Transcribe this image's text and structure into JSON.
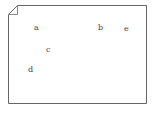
{
  "diagram": {
    "shape": "document-with-folded-corner",
    "border_color": "#666666",
    "labels": [
      {
        "text": "a",
        "x": 34,
        "y": 30
      },
      {
        "text": "b",
        "x": 99,
        "y": 30
      },
      {
        "text": "e",
        "x": 124,
        "y": 31
      },
      {
        "text": "c",
        "x": 46,
        "y": 52
      },
      {
        "text": "d",
        "x": 29,
        "y": 72
      }
    ]
  }
}
